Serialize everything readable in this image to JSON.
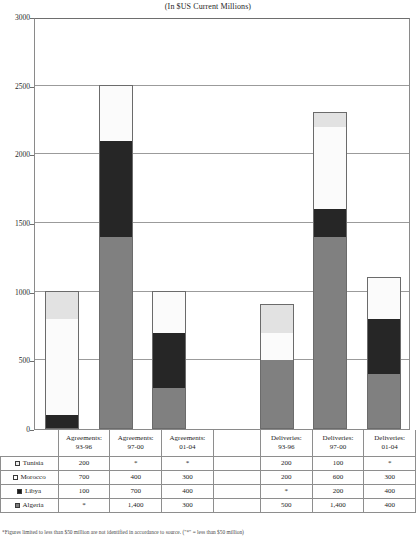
{
  "chart_title": "(In $US Current Millions)",
  "footnote": "*Figures limited to less than $50 million are not identified in accordance to source. (\"*\" = less than $50 million)",
  "axis": {
    "y_ticks": [
      "0",
      "500",
      "1000",
      "1500",
      "2000",
      "2500",
      "3000"
    ],
    "y_min": 0,
    "y_max": 3000
  },
  "colors": {
    "tunisia": "#e2e2e2",
    "morocco": "#fbfbfb",
    "libya": "#262626",
    "algeria": "#808080",
    "grid": "#9b9b9b",
    "frame": "#8a8a8a"
  },
  "table": {
    "column_headers": [
      {
        "line1": "Agreements:",
        "line2": "93-96"
      },
      {
        "line1": "Agreements:",
        "line2": "97-00"
      },
      {
        "line1": "Agreements:",
        "line2": "01-04"
      },
      {
        "line1": "",
        "line2": ""
      },
      {
        "line1": "Deliveries:",
        "line2": "93-96"
      },
      {
        "line1": "Deliveries:",
        "line2": "97-00"
      },
      {
        "line1": "Deliveries:",
        "line2": "01-04"
      }
    ],
    "rows": [
      {
        "country": "Tunisia",
        "swatch": "sw-tunisia",
        "values": [
          "200",
          "*",
          "*",
          "",
          "200",
          "100",
          "*"
        ]
      },
      {
        "country": "Morocco",
        "swatch": "sw-morocco",
        "values": [
          "700",
          "400",
          "300",
          "",
          "200",
          "600",
          "300"
        ]
      },
      {
        "country": "Libya",
        "swatch": "sw-libya",
        "values": [
          "100",
          "700",
          "400",
          "",
          "*",
          "200",
          "400"
        ]
      },
      {
        "country": "Algeria",
        "swatch": "sw-algeria",
        "values": [
          "*",
          "1,400",
          "300",
          "",
          "500",
          "1,400",
          "400"
        ]
      }
    ]
  },
  "chart_data": {
    "type": "bar",
    "subtype": "stacked-column",
    "title": "(In $US Current Millions)",
    "xlabel": "",
    "ylabel": "",
    "ylim": [
      0,
      3000
    ],
    "y_ticks": [
      0,
      500,
      1000,
      1500,
      2000,
      2500,
      3000
    ],
    "grid": true,
    "legend_position": "table-row-labels",
    "categories": [
      "Agreements: 93-96",
      "Agreements: 97-00",
      "Agreements: 01-04",
      "",
      "Deliveries: 93-96",
      "Deliveries: 97-00",
      "Deliveries: 01-04"
    ],
    "stack_order_bottom_to_top": [
      "Algeria",
      "Libya",
      "Morocco",
      "Tunisia"
    ],
    "series": [
      {
        "name": "Algeria",
        "color": "#808080",
        "values": [
          0,
          1400,
          300,
          null,
          500,
          1400,
          400
        ]
      },
      {
        "name": "Libya",
        "color": "#262626",
        "values": [
          100,
          700,
          400,
          null,
          0,
          200,
          400
        ]
      },
      {
        "name": "Morocco",
        "color": "#fbfbfb",
        "values": [
          700,
          400,
          300,
          null,
          200,
          600,
          300
        ]
      },
      {
        "name": "Tunisia",
        "color": "#e2e2e2",
        "values": [
          200,
          0,
          0,
          null,
          200,
          100,
          0
        ]
      }
    ],
    "totals": [
      1000,
      2500,
      1000,
      null,
      900,
      2300,
      1100
    ]
  }
}
